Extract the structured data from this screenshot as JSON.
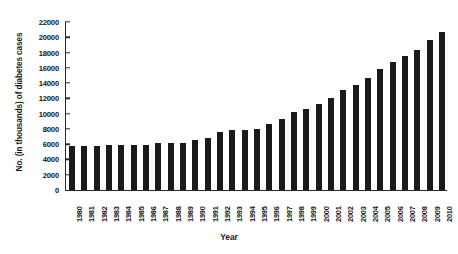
{
  "chart_data": {
    "type": "bar",
    "title": "",
    "xlabel": "Year",
    "ylabel": "No. (in thousands) of diabetes cases",
    "ylim": [
      0,
      22000
    ],
    "ytick_step": 2000,
    "yticks": [
      0,
      2000,
      4000,
      6000,
      8000,
      10000,
      12000,
      14000,
      16000,
      18000,
      20000,
      22000
    ],
    "ytick_labels": [
      "0",
      "2000",
      "4000",
      "6000",
      "8000",
      "10000",
      "12000",
      "14000",
      "16000",
      "18000",
      "20000",
      "22000"
    ],
    "grid": false,
    "legend": "none",
    "bar_color": "#1a1a1a",
    "categories": [
      "1980",
      "1981",
      "1982",
      "1983",
      "1984",
      "1985",
      "1986",
      "1987",
      "1988",
      "1989",
      "1990",
      "1991",
      "1992",
      "1993",
      "1994",
      "1995",
      "1996",
      "1997",
      "1998",
      "1999",
      "2000",
      "2001",
      "2002",
      "2003",
      "2004",
      "2005",
      "2006",
      "2007",
      "2008",
      "2009",
      "2010"
    ],
    "values": [
      5800,
      5800,
      5800,
      5850,
      5850,
      5900,
      5900,
      6100,
      6100,
      6200,
      6500,
      6800,
      7600,
      7800,
      7900,
      8000,
      8600,
      9300,
      10200,
      10600,
      11300,
      12000,
      13100,
      13800,
      14700,
      15800,
      16800,
      17500,
      18300,
      19700,
      20700
    ],
    "units": "thousands of cases"
  }
}
